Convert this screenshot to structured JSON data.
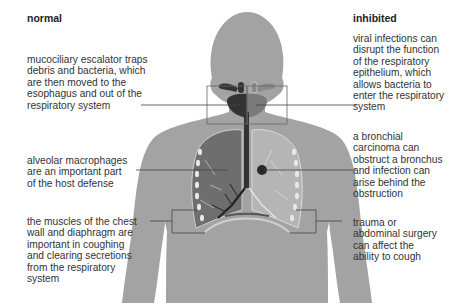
{
  "headings": {
    "left": "normal",
    "right": "inhibited"
  },
  "notes": {
    "left": [
      {
        "id": "mucociliary",
        "lines": [
          "mucociliary escalator traps",
          "debris and bacteria, which",
          "are then moved to the",
          "esophagus and out of the",
          "respiratory system"
        ]
      },
      {
        "id": "macrophages",
        "lines": [
          "alveolar macrophages",
          "are an important part",
          "of the host defense"
        ]
      },
      {
        "id": "muscles",
        "lines": [
          "the muscles of the chest",
          "wall and diaphragm are",
          "important in coughing",
          "and clearing secretions",
          "from the respiratory",
          "system"
        ]
      }
    ],
    "right": [
      {
        "id": "viral",
        "lines": [
          "viral infections can",
          "disrupt the function",
          "of the respiratory",
          "epithelium, which",
          "allows bacteria to",
          "enter the respiratory",
          "system"
        ]
      },
      {
        "id": "carcinoma",
        "lines": [
          "a bronchial",
          "carcinoma can",
          "obstruct a bronchus",
          "and infection can",
          "arise behind the",
          "obstruction"
        ]
      },
      {
        "id": "trauma",
        "lines": [
          "trauma or",
          "abdominal surgery",
          "can affect the",
          "ability to cough"
        ]
      }
    ]
  },
  "colors": {
    "body": "#a3a3a3",
    "body_outline": "#8c8c8c",
    "lung_normal": "#6e6e6e",
    "lung_inhibited": "#b5b5b5",
    "airway_dark": "#333333",
    "leader_line": "#444444"
  }
}
